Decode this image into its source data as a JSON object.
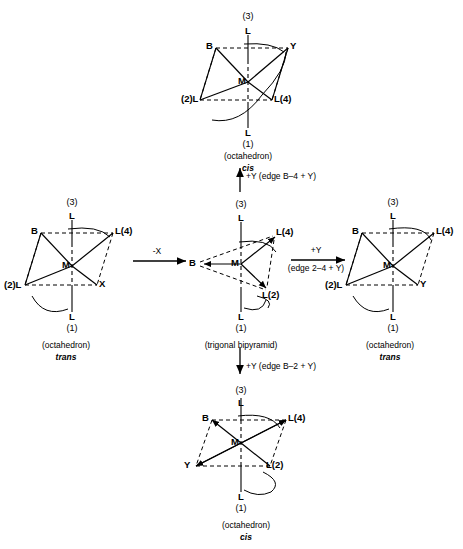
{
  "diagram": {
    "atom_labels": {
      "metal": "M",
      "ligand": "L",
      "base": "B",
      "leaving_group": "X",
      "entering_group": "Y"
    }
  },
  "structures": [
    {
      "id": "top-octahedron",
      "caption_geometry": "(octahedron)",
      "caption_isomer": "cis",
      "vertices": [
        {
          "name": "axial-top-L",
          "label": "L"
        },
        {
          "name": "axial-top-number",
          "label": "(3)"
        },
        {
          "name": "equatorial-back-left-B",
          "label": "B"
        },
        {
          "name": "equatorial-back-right-Y",
          "label": "Y"
        },
        {
          "name": "equatorial-front-left-L",
          "label": "(2)L"
        },
        {
          "name": "equatorial-front-right-L",
          "label": "L(4)"
        },
        {
          "name": "center-metal",
          "label": "M"
        },
        {
          "name": "axial-bottom-L",
          "label": "L"
        },
        {
          "name": "axial-bottom-number",
          "label": "(1)"
        }
      ]
    },
    {
      "id": "left-octahedron",
      "caption_geometry": "(octahedron)",
      "caption_isomer": "trans",
      "vertices": [
        {
          "name": "axial-top-L",
          "label": "L"
        },
        {
          "name": "axial-top-number",
          "label": "(3)"
        },
        {
          "name": "equatorial-back-left-B",
          "label": "B"
        },
        {
          "name": "equatorial-back-right-L",
          "label": "L(4)"
        },
        {
          "name": "equatorial-front-left-L",
          "label": "(2)L"
        },
        {
          "name": "equatorial-front-right-X",
          "label": "X"
        },
        {
          "name": "center-metal",
          "label": "M"
        },
        {
          "name": "axial-bottom-L",
          "label": "L"
        },
        {
          "name": "axial-bottom-number",
          "label": "(1)"
        }
      ]
    },
    {
      "id": "center-trigonal-bipyramid",
      "caption_geometry": "(trigonal bipyramid)",
      "caption_isomer": "",
      "vertices": [
        {
          "name": "axial-top-L",
          "label": "L"
        },
        {
          "name": "axial-top-number",
          "label": "(3)"
        },
        {
          "name": "equatorial-left-B",
          "label": "B"
        },
        {
          "name": "equatorial-upper-right-L",
          "label": "L(4)"
        },
        {
          "name": "equatorial-lower-right-L",
          "label": "L(2)"
        },
        {
          "name": "center-metal",
          "label": "M"
        },
        {
          "name": "axial-bottom-L",
          "label": "L"
        },
        {
          "name": "axial-bottom-number",
          "label": "(1)"
        }
      ]
    },
    {
      "id": "right-octahedron",
      "caption_geometry": "(octahedron)",
      "caption_isomer": "trans",
      "vertices": [
        {
          "name": "axial-top-L",
          "label": "L"
        },
        {
          "name": "axial-top-number",
          "label": "(3)"
        },
        {
          "name": "equatorial-back-left-B",
          "label": "B"
        },
        {
          "name": "equatorial-back-right-L",
          "label": "L(4)"
        },
        {
          "name": "equatorial-front-left-L",
          "label": "(2)L"
        },
        {
          "name": "equatorial-front-right-Y",
          "label": "Y"
        },
        {
          "name": "center-metal",
          "label": "M"
        },
        {
          "name": "axial-bottom-L",
          "label": "L"
        },
        {
          "name": "axial-bottom-number",
          "label": "(1)"
        }
      ]
    },
    {
      "id": "bottom-octahedron",
      "caption_geometry": "(octahedron)",
      "caption_isomer": "cis",
      "vertices": [
        {
          "name": "axial-top-L",
          "label": "L"
        },
        {
          "name": "axial-top-number",
          "label": "(3)"
        },
        {
          "name": "equatorial-back-left-B",
          "label": "B"
        },
        {
          "name": "equatorial-back-right-L",
          "label": "L(4)"
        },
        {
          "name": "equatorial-front-left-Y",
          "label": "Y"
        },
        {
          "name": "equatorial-front-right-L",
          "label": "L(2)"
        },
        {
          "name": "center-metal",
          "label": "M"
        },
        {
          "name": "axial-bottom-L",
          "label": "L"
        },
        {
          "name": "axial-bottom-number",
          "label": "(1)"
        }
      ]
    }
  ],
  "reaction_arrows": [
    {
      "id": "arrow-minus-x",
      "direction": "right",
      "label_top": "-X",
      "label_bottom": ""
    },
    {
      "id": "arrow-up-b4",
      "direction": "up",
      "label_top": "+Y (edge B–4 + Y)",
      "label_bottom": ""
    },
    {
      "id": "arrow-down-b2",
      "direction": "down",
      "label_top": "+Y (edge B–2 + Y)",
      "label_bottom": ""
    },
    {
      "id": "arrow-plus-y-right",
      "direction": "right",
      "label_top": "+Y",
      "label_bottom": "(edge 2–4 + Y)"
    }
  ]
}
